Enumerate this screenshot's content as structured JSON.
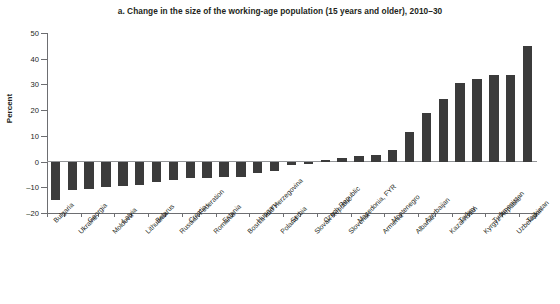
{
  "chart_data": {
    "type": "bar",
    "title": "a. Change in the size of the working-age population (15 years and older), 2010–30",
    "xlabel": "",
    "ylabel": "Percent",
    "ylim": [
      -20,
      50
    ],
    "yticks": [
      -20,
      -10,
      0,
      10,
      20,
      30,
      40,
      50
    ],
    "ytick_labels": [
      "–20",
      "–10",
      "0",
      "10",
      "20",
      "30",
      "40",
      "50"
    ],
    "grid": false,
    "legend": "none",
    "bar_color": "#3b3b3b",
    "categories": [
      "Bulgaria",
      "Ukraine",
      "Georgia",
      "Moldova",
      "Latvia",
      "Lithuania",
      "Belarus",
      "Russian Federation",
      "Croatia",
      "Romania",
      "Estonia",
      "Bosnia and Herzegovina",
      "Hungary",
      "Poland",
      "Serbia",
      "Slovak Republic",
      "Czech Republic",
      "Slovenia",
      "Macedonia, FYR",
      "Armenia",
      "Montenegro",
      "Albania",
      "Azerbaijan",
      "Kazakhstan",
      "Turkey",
      "Kyrgyz Republic",
      "Turkmenistan",
      "Uzbekistan",
      "Tajikistan"
    ],
    "values": [
      -15.0,
      -11.0,
      -10.5,
      -10.0,
      -9.5,
      -9.0,
      -8.0,
      -7.0,
      -6.5,
      -6.5,
      -6.0,
      -6.0,
      -4.5,
      -3.5,
      -1.5,
      -0.8,
      0.6,
      1.4,
      2.0,
      2.5,
      4.5,
      11.5,
      19.0,
      24.5,
      30.5,
      32.0,
      33.5,
      33.5,
      45.0
    ]
  }
}
